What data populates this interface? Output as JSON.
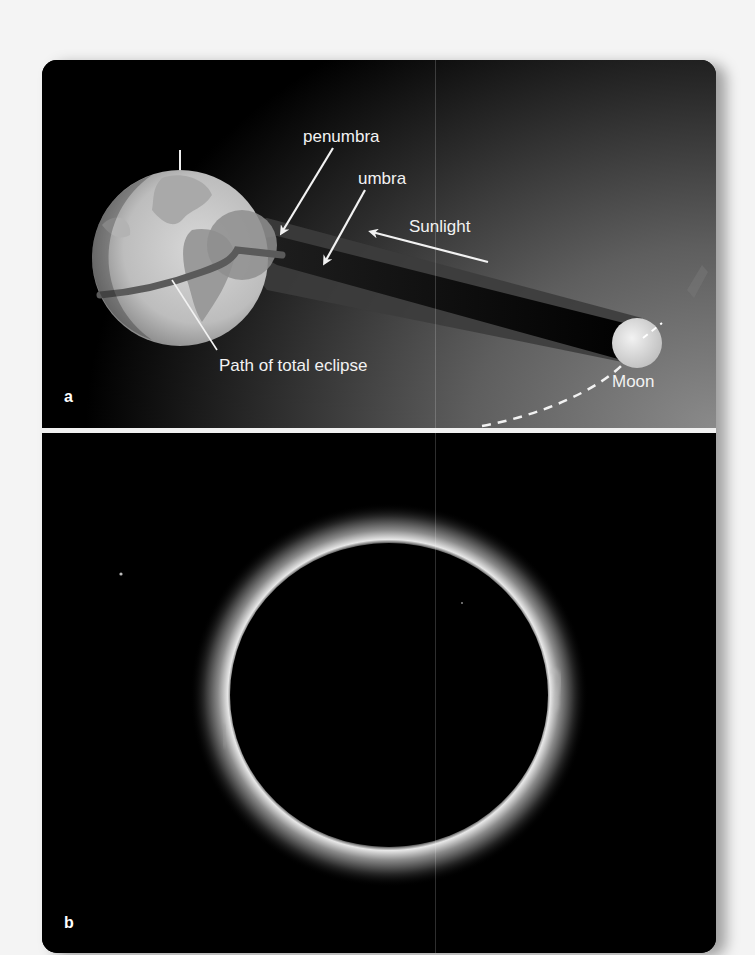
{
  "figure": {
    "panel_a": {
      "letter": "a",
      "labels": {
        "penumbra": "penumbra",
        "umbra": "umbra",
        "sunlight": "Sunlight",
        "path": "Path of total eclipse",
        "moon": "Moon"
      },
      "icons": [
        "earth-globe",
        "moon-sphere",
        "shadow-cone",
        "arrow-penumbra",
        "arrow-umbra",
        "arrow-sunlight",
        "moon-orbit-dashed"
      ]
    },
    "panel_b": {
      "letter": "b",
      "description": "Photograph of total solar eclipse with corona"
    },
    "colors": {
      "background": "#000000",
      "label_text": "#f2f2f2",
      "divider": "#f0f0f0",
      "earth": "#c8c8c8",
      "corona": "#e6e6e6"
    }
  }
}
